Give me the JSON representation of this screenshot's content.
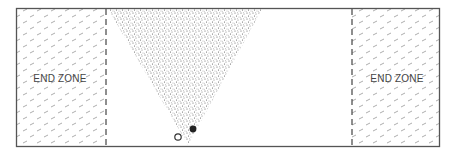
{
  "diagram": {
    "type": "field-zone-coverage",
    "field": {
      "border_color": "#555555",
      "background": "#ffffff"
    },
    "end_zones": [
      {
        "label": "END ZONE",
        "side": "left"
      },
      {
        "label": "END ZONE",
        "side": "right"
      }
    ],
    "coverage_region": {
      "shape": "triangle",
      "fill": "stippled",
      "color": "#555555"
    },
    "players": [
      {
        "marker": "open-circle",
        "team": "offense"
      },
      {
        "marker": "filled-circle",
        "team": "defense"
      }
    ]
  }
}
